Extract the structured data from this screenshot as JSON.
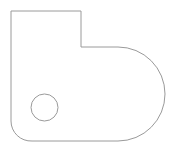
{
  "document": {
    "title": "Technical Line Drawing",
    "view_label": "2D Outline View",
    "background_color": "#ffffff",
    "width_px": 173,
    "height_px": 154
  },
  "style": {
    "stroke_color": "#9a9a9a",
    "stroke_width": 1,
    "fill_color": "none",
    "hole_stroke_color": "#9a9a9a",
    "hole_stroke_width": 1
  },
  "geometry": {
    "shape_name": "stepped-bracket-plate-with-hole",
    "description": "Closed outline: rectangular stepped top-left region, large semicircular right end, rounded bottom-left corner, one circular through-hole",
    "units": "px",
    "profile": {
      "name": "outer-profile",
      "closed": true,
      "vertices": [
        {
          "id": "v1",
          "label": "top-left-corner",
          "x": 11,
          "y": 11,
          "corner": "sharp"
        },
        {
          "id": "v2",
          "label": "top-right-of-step",
          "x": 81,
          "y": 11,
          "corner": "sharp"
        },
        {
          "id": "v3",
          "label": "step-inner-corner",
          "x": 81,
          "y": 47,
          "corner": "sharp"
        },
        {
          "id": "v4",
          "label": "arc-start-upper-right",
          "x": 118,
          "y": 47,
          "corner": "tangent"
        },
        {
          "id": "v5",
          "label": "arc-end-lower-right",
          "x": 118,
          "y": 141,
          "corner": "tangent"
        },
        {
          "id": "v6",
          "label": "bottom-fillet-start",
          "x": 32,
          "y": 141,
          "corner": "tangent"
        },
        {
          "id": "v7",
          "label": "bottom-fillet-end",
          "x": 11,
          "y": 121,
          "corner": "tangent"
        }
      ],
      "arcs": [
        {
          "id": "a1",
          "label": "large-right-end-semicircle",
          "from": "v4",
          "to": "v5",
          "center_x": 118,
          "center_y": 94,
          "radius": 47,
          "sweep": "clockwise",
          "large_arc": false
        },
        {
          "id": "a2",
          "label": "bottom-left-fillet",
          "from": "v6",
          "to": "v7",
          "center_x": 32,
          "center_y": 121,
          "radius": 20,
          "sweep": "clockwise",
          "large_arc": false
        }
      ]
    },
    "holes": [
      {
        "id": "h1",
        "label": "circular-through-hole",
        "type": "circle",
        "center_x": 44.5,
        "center_y": 107.5,
        "radius": 13.5,
        "diameter": 27
      }
    ],
    "bounding_box": {
      "min_x": 11,
      "min_y": 11,
      "max_x": 165,
      "max_y": 141
    }
  },
  "path_data": {
    "outer": "M 11 11 L 81 11 L 81 47 L 118 47 A 47 47 0 0 1 118 141 L 32 141 A 20 20 0 0 1 11 121 Z",
    "hole": "M 58 107.5 A 13.5 13.5 0 1 1 31 107.5 A 13.5 13.5 0 1 1 58 107.5 Z"
  }
}
